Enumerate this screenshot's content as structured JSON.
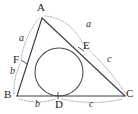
{
  "figure": {
    "canvas": {
      "width": 138,
      "height": 114
    },
    "colors": {
      "background": "#ffffff",
      "triangle_stroke": "#3c3c4a",
      "circle_stroke": "#4a4a52",
      "arc_stroke": "#9a9aa6",
      "label_text": "#1a1a1a",
      "segment_text": "#2b2b2b"
    },
    "vertices": [
      {
        "name": "A",
        "label": "A",
        "x": 42,
        "y": 18,
        "label_x": 37,
        "label_y": 3
      },
      {
        "name": "B",
        "label": "B",
        "x": 17,
        "y": 96,
        "label_x": 5,
        "label_y": 91
      },
      {
        "name": "C",
        "label": "C",
        "x": 125,
        "y": 96,
        "label_x": 127,
        "label_y": 90
      }
    ],
    "tangent_points": [
      {
        "name": "D",
        "label": "D",
        "x": 58,
        "y": 96,
        "label_x": 56,
        "label_y": 99
      },
      {
        "name": "E",
        "label": "E",
        "x": 81,
        "y": 49,
        "label_x": 83,
        "label_y": 42
      },
      {
        "name": "F",
        "label": "F",
        "x": 24,
        "y": 62,
        "label_x": 14,
        "label_y": 55
      }
    ],
    "incircle": {
      "cx": 59,
      "cy": 72,
      "r": 24
    },
    "segment_labels": [
      {
        "name": "segment-a-right",
        "text": "a",
        "x": 87,
        "y": 23,
        "describes": "A to E along AC"
      },
      {
        "name": "segment-a-left",
        "text": "a",
        "x": 21,
        "y": 37,
        "describes": "A to F along AB"
      },
      {
        "name": "segment-b-left",
        "text": "b",
        "x": 11,
        "y": 70,
        "describes": "F to B along AB"
      },
      {
        "name": "segment-b-bottom",
        "text": "b",
        "x": 36,
        "y": 100,
        "describes": "B to D along BC"
      },
      {
        "name": "segment-c-bottom",
        "text": "c",
        "x": 90,
        "y": 100,
        "describes": "D to C along BC"
      },
      {
        "name": "segment-c-right",
        "text": "c",
        "x": 108,
        "y": 58,
        "describes": "E to C along AC"
      }
    ],
    "arcs": [
      {
        "name": "arc-a-right",
        "from": "A",
        "to": "E",
        "style": "dotted"
      },
      {
        "name": "arc-a-left",
        "from": "A",
        "to": "F",
        "style": "dotted"
      },
      {
        "name": "arc-b-left",
        "from": "F",
        "to": "B",
        "style": "dotted"
      },
      {
        "name": "arc-b-bottom",
        "from": "B",
        "to": "D",
        "style": "dotted"
      },
      {
        "name": "arc-c-bottom",
        "from": "D",
        "to": "C",
        "style": "dotted"
      },
      {
        "name": "arc-c-right",
        "from": "E",
        "to": "C",
        "style": "dotted"
      }
    ]
  }
}
